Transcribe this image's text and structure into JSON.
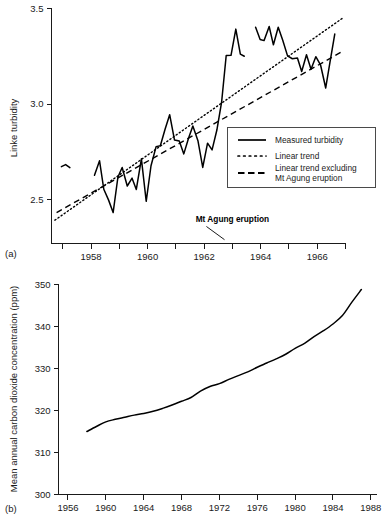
{
  "figure": {
    "panel_a_label": "(a)",
    "panel_b_label": "(b)"
  },
  "chart_data": [
    {
      "id": "panel-a",
      "type": "line",
      "title": "",
      "xlabel": "",
      "ylabel": "Linke turbidity",
      "xlim": [
        1956.6,
        1967.0
      ],
      "ylim": [
        2.27,
        3.5
      ],
      "grid": false,
      "xticks": [
        1957,
        1958,
        1959,
        1960,
        1961,
        1962,
        1963,
        1964,
        1965,
        1966,
        1967
      ],
      "xtick_labels": [
        "",
        "1958",
        "",
        "1960",
        "",
        "1962",
        "",
        "1964",
        "",
        "1966",
        ""
      ],
      "yticks": [
        2.5,
        3.0,
        3.5
      ],
      "ytick_labels": [
        "2.5",
        "3.0",
        "3.5"
      ],
      "legend_position": "lower-right",
      "annotations": [
        {
          "text": "Mt Agung eruption",
          "x": 1963.0,
          "y": 2.38,
          "leader_to_x": 1962.72,
          "leader_to_y": 2.29
        }
      ],
      "series": [
        {
          "name": "Measured turbidity",
          "style": "solid",
          "legend_key": "measured-turbidity",
          "segments": [
            {
              "x": [
                1956.95,
                1957.1,
                1957.25
              ],
              "values": [
                2.672,
                2.683,
                2.667
              ]
            },
            {
              "x": [
                1958.12,
                1958.3,
                1958.45,
                1958.62,
                1958.78,
                1958.95,
                1959.1,
                1959.28,
                1959.45,
                1959.6,
                1959.78,
                1959.95,
                1960.12,
                1960.3,
                1960.45,
                1960.62,
                1960.78,
                1960.95,
                1961.12,
                1961.28,
                1961.45,
                1961.6,
                1961.78,
                1961.95,
                1962.12,
                1962.28,
                1962.45,
                1962.62,
                1962.78,
                1962.95,
                1963.12,
                1963.28,
                1963.42
              ],
              "values": [
                2.627,
                2.703,
                2.554,
                2.497,
                2.432,
                2.618,
                2.668,
                2.571,
                2.612,
                2.553,
                2.713,
                2.491,
                2.677,
                2.777,
                2.782,
                2.869,
                2.944,
                2.812,
                2.806,
                2.739,
                2.822,
                2.885,
                2.808,
                2.668,
                2.795,
                2.76,
                2.864,
                3.013,
                3.254,
                3.255,
                3.392,
                3.261,
                3.25
              ]
            },
            {
              "x": [
                1963.82,
                1963.98,
                1964.12,
                1964.3,
                1964.45,
                1964.62,
                1964.78,
                1964.95,
                1965.12,
                1965.3,
                1965.45,
                1965.62,
                1965.78,
                1965.95,
                1966.12,
                1966.3,
                1966.45,
                1966.62
              ],
              "values": [
                3.402,
                3.338,
                3.332,
                3.406,
                3.31,
                3.402,
                3.334,
                3.252,
                3.237,
                3.241,
                3.17,
                3.258,
                3.182,
                3.248,
                3.203,
                3.084,
                3.218,
                3.366
              ]
            }
          ]
        },
        {
          "name": "Linear trend",
          "style": "dotted",
          "legend_key": "linear-trend",
          "endpoints": {
            "x": [
              1956.72,
              1966.95
            ],
            "values": [
              2.392,
              3.455
            ]
          }
        },
        {
          "name": "Linear trend excluding Mt Agung eruption",
          "style": "dashed",
          "legend_key": "linear-trend-excluding",
          "endpoints": {
            "x": [
              1956.78,
              1966.9
            ],
            "values": [
              2.432,
              3.276
            ]
          }
        }
      ],
      "legend": [
        {
          "key": "measured-turbidity",
          "style": "solid",
          "label": "Measured turbidity"
        },
        {
          "key": "linear-trend",
          "style": "dotted",
          "label": "Linear trend"
        },
        {
          "key": "linear-trend-excluding",
          "style": "dashed",
          "label_line1": "Linear trend excluding",
          "label_line2": "Mt Agung eruption"
        }
      ]
    },
    {
      "id": "panel-b",
      "type": "line",
      "title": "",
      "xlabel": "",
      "ylabel": "Mean annual carbon dioxide concentration (ppm)",
      "xlim": [
        1955.0,
        1988.6
      ],
      "ylim": [
        300,
        350
      ],
      "grid": false,
      "xticks": [
        1956,
        1960,
        1964,
        1968,
        1972,
        1976,
        1980,
        1984,
        1988
      ],
      "xtick_labels": [
        "1956",
        "1960",
        "1964",
        "1968",
        "1972",
        "1976",
        "1980",
        "1984",
        "1988"
      ],
      "yticks": [
        300,
        310,
        320,
        330,
        340,
        350
      ],
      "ytick_labels": [
        "300",
        "310",
        "320",
        "330",
        "340",
        "350"
      ],
      "legend_position": "none",
      "series": [
        {
          "name": "Mean annual carbon dioxide concentration",
          "style": "solid",
          "x": [
            1958,
            1959,
            1960,
            1961,
            1962,
            1963,
            1964,
            1965,
            1966,
            1967,
            1968,
            1969,
            1970,
            1971,
            1972,
            1973,
            1974,
            1975,
            1976,
            1977,
            1978,
            1979,
            1980,
            1981,
            1982,
            1983,
            1984,
            1985,
            1986,
            1987
          ],
          "values": [
            315.0,
            316.2,
            317.3,
            317.9,
            318.4,
            318.9,
            319.3,
            319.8,
            320.5,
            321.3,
            322.2,
            323.1,
            324.6,
            325.7,
            326.4,
            327.4,
            328.3,
            329.2,
            330.3,
            331.3,
            332.3,
            333.4,
            334.8,
            336.0,
            337.6,
            339.0,
            340.6,
            342.6,
            345.8,
            348.8
          ]
        }
      ]
    }
  ]
}
